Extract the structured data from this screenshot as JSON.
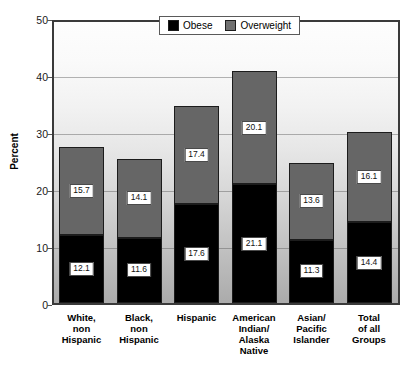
{
  "chart_data": {
    "type": "bar",
    "subtype": "stacked-bar",
    "title": "",
    "xlabel": "",
    "ylabel": "Percent",
    "ylim": [
      0,
      50
    ],
    "yticks": [
      0,
      10,
      20,
      30,
      40,
      50
    ],
    "grid": true,
    "legend_position": "top-center",
    "categories": [
      "White, non Hispanic",
      "Black, non Hispanic",
      "Hispanic",
      "American Indian/ Alaska Native",
      "Asian/ Pacific Islander",
      "Total of all Groups"
    ],
    "category_lines": [
      [
        "White,",
        "non",
        "Hispanic"
      ],
      [
        "Black,",
        "non",
        "Hispanic"
      ],
      [
        "Hispanic"
      ],
      [
        "American",
        "Indian/",
        "Alaska",
        "Native"
      ],
      [
        "Asian/",
        "Pacific",
        "Islander"
      ],
      [
        "Total",
        "of all",
        "Groups"
      ]
    ],
    "series": [
      {
        "name": "Obese",
        "color": "#000000",
        "values": [
          12.1,
          11.6,
          17.6,
          21.1,
          11.3,
          14.4
        ],
        "labels": [
          "12.1",
          "11.6",
          "17.6",
          "21.1",
          "11.3",
          "14.4"
        ]
      },
      {
        "name": "Overweight",
        "color": "#666666",
        "values": [
          15.7,
          14.1,
          17.4,
          20.1,
          13.6,
          16.1
        ],
        "labels": [
          "15.7",
          "14.1",
          "17.4",
          "20.1",
          "13.6",
          "16.1"
        ]
      }
    ],
    "totals": [
      27.8,
      25.7,
      35.0,
      41.2,
      24.9,
      30.5
    ]
  },
  "axis": {
    "y_tick_labels": [
      "50",
      "40",
      "30",
      "20",
      "10",
      "0"
    ],
    "y_title": "Percent"
  },
  "legend": {
    "items": [
      {
        "label": "Obese",
        "color": "#000000"
      },
      {
        "label": "Overweight",
        "color": "#707070"
      }
    ]
  }
}
